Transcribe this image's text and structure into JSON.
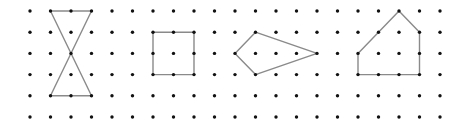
{
  "grid": {
    "columns": 21,
    "rows": 6,
    "origin_x": 30,
    "origin_y": 11,
    "pitch_x": 20.5,
    "pitch_y": 21.2,
    "dot_radius": 1.7,
    "dot_color": "#111111"
  },
  "shapes": [
    {
      "name": "hourglass",
      "vertices": [
        [
          1,
          0
        ],
        [
          3,
          0
        ],
        [
          1,
          4
        ],
        [
          3,
          4
        ]
      ],
      "closed": true
    },
    {
      "name": "square",
      "vertices": [
        [
          6,
          1
        ],
        [
          8,
          1
        ],
        [
          8,
          3
        ],
        [
          6,
          3
        ]
      ],
      "closed": true
    },
    {
      "name": "kite",
      "vertices": [
        [
          11,
          1
        ],
        [
          14,
          2
        ],
        [
          11,
          3
        ],
        [
          10,
          2
        ]
      ],
      "closed": true
    },
    {
      "name": "pentagon",
      "vertices": [
        [
          16,
          2
        ],
        [
          18,
          0
        ],
        [
          19,
          1
        ],
        [
          19,
          3
        ],
        [
          16,
          3
        ]
      ],
      "closed": true
    }
  ],
  "line_color": "#8a8a8a"
}
